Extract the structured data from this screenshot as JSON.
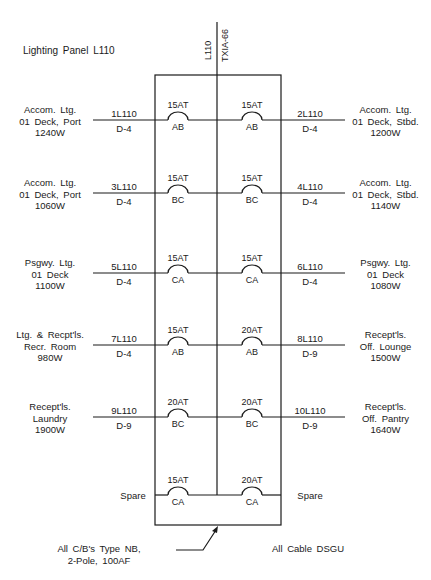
{
  "title": "Lighting Panel L110",
  "feeder": {
    "name": "L110",
    "cable": "TXIA-66"
  },
  "circuits": [
    {
      "id": "1L110",
      "cable": "D-4",
      "breaker": "15AT",
      "phase": "AB",
      "side": "left",
      "load": [
        "Accom. Ltg.",
        "01 Deck, Port",
        "1240W"
      ]
    },
    {
      "id": "2L110",
      "cable": "D-4",
      "breaker": "15AT",
      "phase": "AB",
      "side": "right",
      "load": [
        "Accom. Ltg.",
        "01 Deck, Stbd.",
        "1200W"
      ]
    },
    {
      "id": "3L110",
      "cable": "D-4",
      "breaker": "15AT",
      "phase": "BC",
      "side": "left",
      "load": [
        "Accom. Ltg.",
        "01 Deck, Port",
        "1060W"
      ]
    },
    {
      "id": "4L110",
      "cable": "D-4",
      "breaker": "15AT",
      "phase": "BC",
      "side": "right",
      "load": [
        "Accom. Ltg.",
        "01 Deck, Stbd.",
        "1140W"
      ]
    },
    {
      "id": "5L110",
      "cable": "D-4",
      "breaker": "15AT",
      "phase": "CA",
      "side": "left",
      "load": [
        "Psgwy. Ltg.",
        "01 Deck",
        "1100W"
      ]
    },
    {
      "id": "6L110",
      "cable": "D-4",
      "breaker": "15AT",
      "phase": "CA",
      "side": "right",
      "load": [
        "Psgwy. Ltg.",
        "01 Deck",
        "1080W"
      ]
    },
    {
      "id": "7L110",
      "cable": "D-4",
      "breaker": "15AT",
      "phase": "AB",
      "side": "left",
      "load": [
        "Ltg. & Recpt'ls.",
        "Recr. Room",
        "980W"
      ]
    },
    {
      "id": "8L110",
      "cable": "D-9",
      "breaker": "20AT",
      "phase": "AB",
      "side": "right",
      "load": [
        "Recept'ls.",
        "Off. Lounge",
        "1500W"
      ]
    },
    {
      "id": "9L110",
      "cable": "D-9",
      "breaker": "20AT",
      "phase": "BC",
      "side": "left",
      "load": [
        "Recept'ls.",
        "Laundry",
        "1900W"
      ]
    },
    {
      "id": "10L110",
      "cable": "D-9",
      "breaker": "20AT",
      "phase": "BC",
      "side": "right",
      "load": [
        "Recept'ls.",
        "Off. Pantry",
        "1640W"
      ]
    }
  ],
  "spares": [
    {
      "label": "Spare",
      "breaker": "15AT",
      "phase": "CA",
      "side": "left"
    },
    {
      "label": "Spare",
      "breaker": "20AT",
      "phase": "CA",
      "side": "right"
    }
  ],
  "notes": {
    "breakers": [
      "All C/B's Type NB,",
      "2-Pole, 100AF"
    ],
    "cable": "All Cable DSGU"
  }
}
